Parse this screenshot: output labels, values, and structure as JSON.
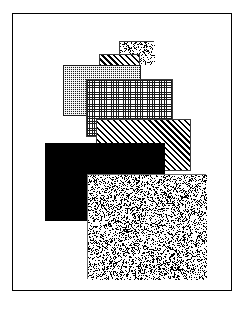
{
  "figure": {
    "frame": {
      "name": "figure-border",
      "stroke_color": "#000000",
      "fill_color": "#ffffff",
      "x": 12,
      "y": 13,
      "width": 220,
      "height": 278
    },
    "canvas": {
      "width": 245,
      "height": 314,
      "background": "#ffffff"
    },
    "swatches": [
      {
        "id": "swatch-1",
        "pattern": "speckle-coarse",
        "label": "coarse speckle",
        "fill_color": "#ffffff",
        "ink_color": "#141414",
        "stroke_color": "#3a3a3a",
        "x": 106,
        "y": 27,
        "width": 35,
        "height": 23,
        "z": 1
      },
      {
        "id": "swatch-2",
        "pattern": "hatch-diagonal",
        "label": "diagonal hatch",
        "fill_color": "#ffffff",
        "ink_color": "#000000",
        "stroke_color": "#3a3a3a",
        "x": 86,
        "y": 40,
        "width": 41,
        "height": 19,
        "z": 2
      },
      {
        "id": "swatch-3",
        "pattern": "crosshatch-dark",
        "label": "dense dark crosshatch",
        "fill_color": "#1b1b1b",
        "ink_color": "#ffffff",
        "stroke_color": "#1b1b1b",
        "x": 50,
        "y": 51,
        "width": 78,
        "height": 51,
        "z": 3
      },
      {
        "id": "swatch-4",
        "pattern": "grid-fine",
        "label": "fine open grid",
        "fill_color": "#ffffff",
        "ink_color": "#1a1a1a",
        "stroke_color": "#3a3a3a",
        "x": 73,
        "y": 65,
        "width": 87,
        "height": 58,
        "z": 4
      },
      {
        "id": "swatch-5",
        "pattern": "hatch-diagonal",
        "label": "diagonal hatch",
        "fill_color": "#ffffff",
        "ink_color": "#000000",
        "stroke_color": "#3a3a3a",
        "x": 83,
        "y": 105,
        "width": 95,
        "height": 52,
        "z": 5
      },
      {
        "id": "swatch-6",
        "pattern": "solid-black",
        "label": "solid black",
        "fill_color": "#000000",
        "ink_color": "#000000",
        "stroke_color": "#000000",
        "x": 32,
        "y": 129,
        "width": 120,
        "height": 78,
        "z": 6
      },
      {
        "id": "swatch-7",
        "pattern": "noise-fine",
        "label": "fine random noise",
        "fill_color": "#ffffff",
        "ink_color": "#111111",
        "stroke_color": "#6a6a6a",
        "x": 74,
        "y": 160,
        "width": 119,
        "height": 105,
        "z": 7
      }
    ]
  }
}
